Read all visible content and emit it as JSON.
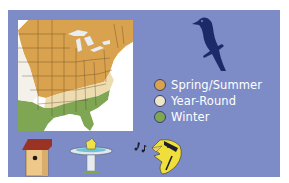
{
  "panel": {
    "background": "#7d8cc6"
  },
  "map": {
    "region": "Eastern United States",
    "colors": {
      "spring_summer": "#d9a24f",
      "year_round": "#ecdcb0",
      "winter": "#7fa653",
      "background": "#ffffff",
      "water": "#e8eef4"
    }
  },
  "legend": {
    "items": [
      {
        "label": "Spring/Summer",
        "color": "#d9a24f"
      },
      {
        "label": "Year-Round",
        "color": "#efe6c8"
      },
      {
        "label": "Winter",
        "color": "#7fa653"
      }
    ]
  },
  "icons": {
    "bird_silhouette": "perched-bird-icon",
    "birdhouse": "birdhouse-icon",
    "birdbath": "birdbath-icon",
    "singing_bird": "singing-bird-icon"
  }
}
